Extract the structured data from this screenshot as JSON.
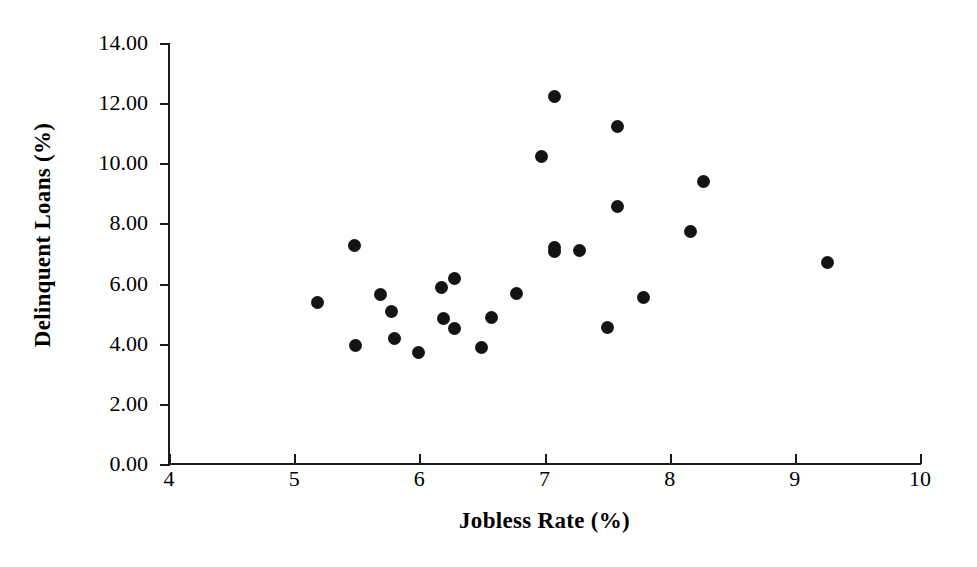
{
  "chart_data": {
    "type": "scatter",
    "title": "",
    "xlabel": "Jobless Rate (%)",
    "ylabel": "Delinquent Loans (%)",
    "xlim": [
      4,
      10
    ],
    "ylim": [
      0.0,
      14.0
    ],
    "xticks": [
      "4",
      "5",
      "6",
      "7",
      "8",
      "9",
      "10"
    ],
    "xtick_values": [
      4,
      5,
      6,
      7,
      8,
      9,
      10
    ],
    "yticks": [
      "0.00",
      "2.00",
      "4.00",
      "6.00",
      "8.00",
      "10.00",
      "12.00",
      "14.00"
    ],
    "ytick_values": [
      0,
      2,
      4,
      6,
      8,
      10,
      12,
      14
    ],
    "grid": false,
    "legend": false,
    "marker": "filled-circle",
    "marker_color": "#141414",
    "axis_color": "#1a1a1a",
    "background": "#ffffff",
    "n_points": 26,
    "points": [
      {
        "x": 5.19,
        "y": 5.37
      },
      {
        "x": 5.48,
        "y": 7.27
      },
      {
        "x": 5.49,
        "y": 3.93
      },
      {
        "x": 5.69,
        "y": 5.63
      },
      {
        "x": 5.78,
        "y": 5.07
      },
      {
        "x": 5.8,
        "y": 4.17
      },
      {
        "x": 5.99,
        "y": 3.7
      },
      {
        "x": 6.18,
        "y": 5.87
      },
      {
        "x": 6.19,
        "y": 4.83
      },
      {
        "x": 6.28,
        "y": 6.17
      },
      {
        "x": 6.28,
        "y": 4.5
      },
      {
        "x": 6.5,
        "y": 3.87
      },
      {
        "x": 6.58,
        "y": 4.87
      },
      {
        "x": 6.78,
        "y": 5.67
      },
      {
        "x": 6.98,
        "y": 10.23
      },
      {
        "x": 7.08,
        "y": 12.23
      },
      {
        "x": 7.08,
        "y": 7.07
      },
      {
        "x": 7.08,
        "y": 7.2
      },
      {
        "x": 7.28,
        "y": 7.1
      },
      {
        "x": 7.5,
        "y": 4.53
      },
      {
        "x": 7.58,
        "y": 8.57
      },
      {
        "x": 7.58,
        "y": 11.23
      },
      {
        "x": 7.79,
        "y": 5.53
      },
      {
        "x": 8.17,
        "y": 7.73
      },
      {
        "x": 8.27,
        "y": 9.4
      },
      {
        "x": 9.26,
        "y": 6.7
      }
    ]
  }
}
